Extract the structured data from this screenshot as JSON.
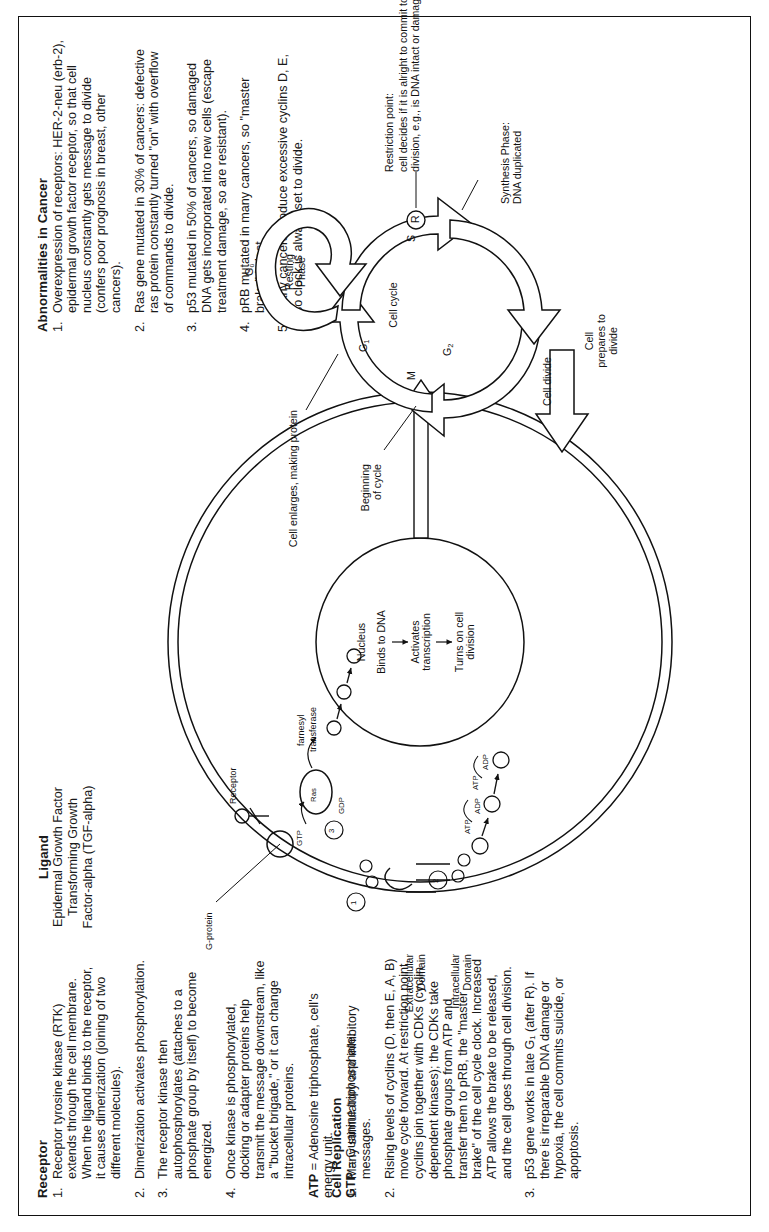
{
  "document": {
    "orientation": "rotated-90-ccw",
    "page_background": "#ffffff",
    "ink_color": "#111111"
  },
  "receptor": {
    "heading": "Receptor",
    "items": [
      "Receptor tyrosine kinase (RTK) extends through the cell membrane. When the ligand binds to the receptor, it causes dimerization (joining of two different molecules).",
      "Dimerization activates phosphorylation.",
      "The receptor kinase then autophosphorylates (attaches to a phosphate group by itself) to become energized.",
      "Once kinase is phosphorylated, docking or adapter proteins help transmit the message downstream, like a \"bucket brigade,\" or it can change intracellular proteins."
    ],
    "numbers": [
      "1.",
      "2.",
      "3.",
      "4."
    ],
    "definitions": [
      {
        "term": "ATP",
        "text": " = Adenosine triphosphate, cell's energy unit."
      },
      {
        "term": "GTP",
        "text": " = Guanine triphosphate."
      }
    ]
  },
  "cell_replication": {
    "heading": "Cell Replication",
    "numbers": [
      "1.",
      "2.",
      "3."
    ],
    "items": [
      "Many stimulatory and inhibitory messages.",
      "Rising levels of cyclins (D, then E, A, B) move cycle forward. At restriction point, cyclins join together with CDKs (cyclin dependent kinases); the CDKs take phosphate groups from ATP and transfer them to pRB, the \"master brake\" of the cell cycle clock. Increased ATP allows the brake to be released, and the cell goes through cell division.",
      "p53 gene works in late G₁ (after R). If there is irreparable DNA damage or hypoxia, the cell commits suicide, or apoptosis."
    ]
  },
  "ligand": {
    "heading": "Ligand",
    "lines": [
      "Epidermal Growth Factor",
      "Transforming Growth",
      "Factor-alpha (TGF-alpha)"
    ]
  },
  "abnormalities": {
    "heading": "Abnormalities in Cancer",
    "numbers": [
      "1.",
      "2.",
      "3.",
      "4.",
      "5."
    ],
    "items": [
      "Overexpression of receptors: HER-2-neu (erb-2), epidermal growth factor receptor, so that cell nucleus constantly gets message to divide (confers poor prognosis in breast, other cancers).",
      "Ras gene mutated in 30% of cancers: defective ras protein constantly turned \"on\" with overflow of commands to divide.",
      "p53 mutated in 50% of cancers, so damaged DNA gets incorporated into new cells (escape treatment damage, so are resistant).",
      "pRB mutated in many cancers, so \"master brake\" is lost.",
      "Many cancers produce excessive cyclins D, E, so clock is always set to divide."
    ]
  },
  "diagram": {
    "labels": {
      "g_protein": "G-protein",
      "receptor": "Receptor",
      "ras": "Ras",
      "gtp": "GTP",
      "gdp": "GDP",
      "farnesyl": "farnesyl",
      "transferase": "transferase",
      "extracellular": "Extracellular",
      "extracellular2": "Domain",
      "intracellular": "Intracellular",
      "intracellular2": "Domain",
      "nucleus": "Nucleus",
      "binds_to_dna": "Binds to DNA",
      "activates": "Activates",
      "transcription": "transcription",
      "turns_on": "Turns on cell",
      "division": "division",
      "atp": "ATP",
      "adp": "ADP",
      "step1": "1",
      "step2": "2",
      "step3": "3",
      "p_marks": [
        "P",
        "P",
        "P",
        "P"
      ]
    },
    "cycle": {
      "center_label": "Cell cycle",
      "g0": "G₀",
      "resting_phase_1": "Resting",
      "resting_phase_2": "Phase",
      "g1": "G₁",
      "g2": "G₂",
      "s": "S",
      "m": "M",
      "r": "R",
      "beginning_1": "Beginning",
      "beginning_2": "of cycle",
      "cell_enlarges": "Cell enlarges, making protein",
      "restriction_point": "Restriction point:",
      "restriction_text": "cell decides if it is alright to commit to cell division, e.g., is DNA intact or damaged?",
      "synthesis_1": "Synthesis Phase:",
      "synthesis_2": "DNA duplicated",
      "cell_divide": "Cell divide",
      "cell_prepares_1": "Cell",
      "cell_prepares_2": "prepares to",
      "cell_prepares_3": "divide"
    }
  }
}
